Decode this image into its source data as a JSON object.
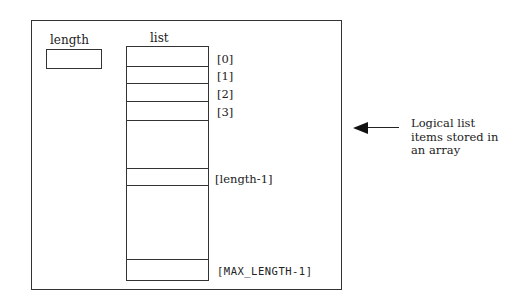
{
  "diagram": {
    "length_label": "length",
    "list_label": "list",
    "indices": {
      "i0": "[0]",
      "i1": "[1]",
      "i2": "[2]",
      "i3": "[3]",
      "last": "[length-1]",
      "max": "[MAX_LENGTH-1]"
    },
    "caption": {
      "line1": "Logical list",
      "line2": "items stored in",
      "line3": "an array"
    },
    "icons": {
      "arrow": "arrow-left-icon"
    },
    "colors": {
      "line": "#333333",
      "background": "#ffffff"
    }
  }
}
